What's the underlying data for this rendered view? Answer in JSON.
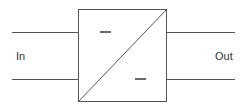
{
  "diagram": {
    "type": "block-diagram",
    "block": {
      "name": "converter",
      "symbol": "DC/DC converter (diagonal split with two minus marks)"
    },
    "input_label": "In",
    "output_label": "Out",
    "colors": {
      "stroke": "#555555",
      "text": "#333333",
      "background": "#ffffff"
    }
  }
}
